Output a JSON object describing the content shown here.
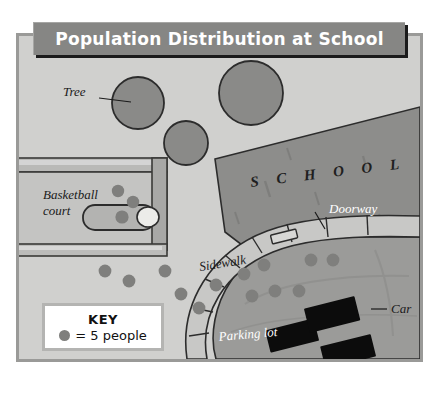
{
  "title": {
    "text": "Population Distribution at School"
  },
  "key": {
    "heading": "KEY",
    "swatch_icon": "person-dot-icon",
    "label": "= 5 people",
    "dot_value": 5
  },
  "map": {
    "labels": {
      "tree": "Tree",
      "basketball_court_line1": "Basketball",
      "basketball_court_line2": "court",
      "school": "S C H O O L",
      "doorway": "Doorway",
      "sidewalk": "Sidewalk",
      "car": "Car",
      "parking_lot": "Parking lot"
    },
    "colors": {
      "background": "#d0d0ce",
      "frame_border": "#9a9a98",
      "banner": "#868684",
      "banner_text": "#ffffff",
      "tree_fill": "#8a8a88",
      "building_fill": "#8d8d8b",
      "sidewalk_fill": "#c8c8c6",
      "parking_fill": "#9b9b99",
      "court_fill": "#c4c4c2",
      "person_dot": "#7f7f7d",
      "car_fill": "#0c0c0c",
      "key_background": "#ffffff"
    },
    "counts": {
      "trees": 3,
      "cars": 3,
      "person_dots": 16
    },
    "person_dots": [
      {
        "x": 115,
        "y": 188
      },
      {
        "x": 130,
        "y": 199
      },
      {
        "x": 119,
        "y": 214
      },
      {
        "x": 102,
        "y": 268
      },
      {
        "x": 126,
        "y": 278
      },
      {
        "x": 162,
        "y": 268
      },
      {
        "x": 178,
        "y": 291
      },
      {
        "x": 213,
        "y": 282
      },
      {
        "x": 196,
        "y": 305
      },
      {
        "x": 241,
        "y": 271
      },
      {
        "x": 261,
        "y": 262
      },
      {
        "x": 249,
        "y": 293
      },
      {
        "x": 272,
        "y": 288
      },
      {
        "x": 296,
        "y": 288
      },
      {
        "x": 308,
        "y": 257
      },
      {
        "x": 330,
        "y": 257
      }
    ],
    "trees": [
      {
        "cx": 135,
        "cy": 100,
        "r": 26
      },
      {
        "cx": 248,
        "cy": 90,
        "r": 32
      },
      {
        "cx": 183,
        "cy": 140,
        "r": 22
      }
    ],
    "cars": [
      {
        "x": 275,
        "y": 312,
        "w": 48,
        "h": 22,
        "rot": -12
      },
      {
        "x": 311,
        "y": 292,
        "w": 48,
        "h": 23,
        "rot": -12
      },
      {
        "x": 327,
        "y": 327,
        "w": 48,
        "h": 22,
        "rot": -12
      }
    ]
  }
}
